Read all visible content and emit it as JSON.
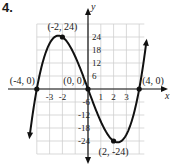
{
  "problem_number": "4.",
  "chart_data": {
    "type": "line",
    "title": "",
    "function": "y = x^3 - 16x",
    "xlabel": "x",
    "ylabel": "y",
    "xlim": [
      -4.8,
      4.6
    ],
    "ylim": [
      -30,
      30
    ],
    "grid": true,
    "x_ticks": [
      -3,
      -2,
      1,
      2,
      3
    ],
    "y_ticks": [
      24,
      18,
      12,
      6,
      -6,
      -12,
      -18,
      -24
    ],
    "x_tick_labels": [
      "-3",
      "-2",
      "1",
      "2",
      "3"
    ],
    "y_tick_labels": [
      "24",
      "18",
      "12",
      "6",
      "-6",
      "-12",
      "-18",
      "-24"
    ],
    "series": [
      {
        "name": "curve",
        "x": [
          -4.6,
          -4,
          -3,
          -2,
          -1,
          0,
          1,
          2,
          3,
          4,
          4.6
        ],
        "y": [
          -23.736,
          0,
          21,
          24,
          15,
          0,
          -15,
          -24,
          -21,
          0,
          23.736
        ]
      }
    ],
    "points": [
      {
        "label": "(-2, 24)",
        "x": -2,
        "y": 24,
        "marked": true
      },
      {
        "label": "(2, -24)",
        "x": 2,
        "y": -24,
        "marked": true
      },
      {
        "label": "(-4, 0)",
        "x": -4,
        "y": 0,
        "marked": true
      },
      {
        "label": "(0, 0)",
        "x": 0,
        "y": 0,
        "marked": true
      },
      {
        "label": "(4, 0)",
        "x": 4,
        "y": 0,
        "marked": true
      }
    ]
  }
}
